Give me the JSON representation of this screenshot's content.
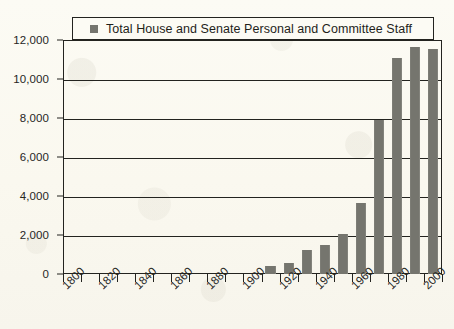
{
  "legend": {
    "marker": "square-swatch",
    "label": "Total House and Senate Personal and Committee Staff",
    "position": "top-inside"
  },
  "axes": {
    "y_ticks": [
      "0",
      "2,000",
      "4,000",
      "6,000",
      "8,000",
      "10,000",
      "12,000"
    ],
    "x_ticks": [
      "1800",
      "1820",
      "1840",
      "1860",
      "1880",
      "1900",
      "1920",
      "1940",
      "1960",
      "1980",
      "2000"
    ]
  },
  "chart_data": {
    "type": "bar",
    "title": "",
    "subtitle": "",
    "xlabel": "",
    "ylabel": "",
    "xlim": [
      1800,
      2010
    ],
    "ylim": [
      0,
      12000
    ],
    "ytick_interval": 2000,
    "xtick_interval": 10,
    "xlabel_interval": 20,
    "grid": true,
    "grid_axis": "y",
    "legend_position": "top-inside",
    "bar_color": "#75756e",
    "axis_color": "#23231f",
    "background_color": "#fbfaf2",
    "series": [
      {
        "name": "Total House and Senate Personal and Committee Staff",
        "color": "#75756e",
        "categories": [
          1910,
          1920,
          1930,
          1940,
          1950,
          1960,
          1970,
          1980,
          1990,
          2000
        ],
        "values": [
          400,
          550,
          1250,
          1500,
          2050,
          3650,
          7900,
          11100,
          11650,
          11550
        ]
      }
    ]
  }
}
